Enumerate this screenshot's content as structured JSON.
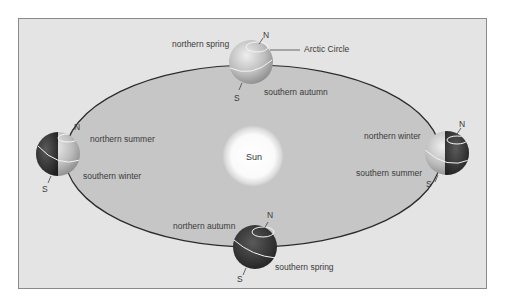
{
  "diagram": {
    "colors": {
      "frame_bg": "#e4e4e4",
      "orbit_fill": "#c6c6c6",
      "orbit_stroke": "#2a2a2a",
      "text": "#3a3a3a"
    },
    "sun": {
      "label": "Sun"
    },
    "positions": [
      {
        "id": "top",
        "north_label": "northern spring",
        "south_label": "southern autumn",
        "pole_n": "N",
        "pole_s": "S",
        "callout": "Arctic Circle"
      },
      {
        "id": "left",
        "north_label": "northern summer",
        "south_label": "southern winter",
        "pole_n": "N",
        "pole_s": "S"
      },
      {
        "id": "right",
        "north_label": "northern winter",
        "south_label": "southern summer",
        "pole_n": "N",
        "pole_s": "S"
      },
      {
        "id": "bottom",
        "north_label": "northern autumn",
        "south_label": "southern spring",
        "pole_n": "N",
        "pole_s": "S"
      }
    ]
  }
}
